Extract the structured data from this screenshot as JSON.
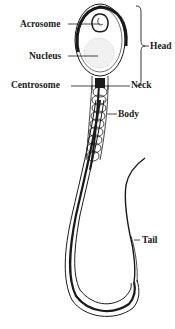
{
  "diagram": {
    "type": "anatomical-illustration",
    "labels": {
      "acrosome": "Acrosome",
      "nucleus": "Nucleus",
      "head": "Head",
      "centrosome": "Centrosome",
      "neck": "Neck",
      "body": "Body",
      "tail": "Tail"
    },
    "colors": {
      "ink": "#1a1a1a",
      "background": "#ffffff",
      "nucleus_stipple": "#cccccc"
    }
  }
}
